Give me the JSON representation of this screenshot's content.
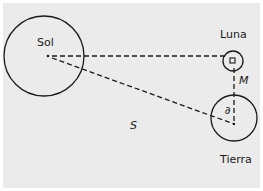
{
  "diagram": {
    "background": "#ebebeb",
    "stroke": "#1a1a1a",
    "labels": {
      "sun": "Sol",
      "moon": "Luna",
      "earth": "Tierra",
      "sun_distance": "S",
      "moon_distance": "M",
      "angle": "∂"
    }
  }
}
